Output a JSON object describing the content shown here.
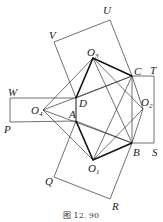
{
  "figure": {
    "caption": "图 12. 90",
    "points": {
      "O1": [
        93,
        160
      ],
      "O2": [
        143,
        109
      ],
      "O3": [
        93,
        58
      ],
      "O4": [
        43,
        110
      ],
      "A": [
        76,
        121
      ],
      "B": [
        132,
        143
      ],
      "C": [
        132,
        76
      ],
      "D": [
        76,
        98
      ],
      "P": [
        10,
        122
      ],
      "W": [
        10,
        98
      ],
      "Q": [
        54,
        177
      ],
      "R": [
        110,
        199
      ],
      "S": [
        154,
        143
      ],
      "T": [
        154,
        76
      ],
      "U": [
        110,
        20
      ],
      "V": [
        54,
        42
      ]
    },
    "labels": [
      {
        "text": "U",
        "sub": "",
        "x": 103,
        "y": 14
      },
      {
        "text": "V",
        "sub": "",
        "x": 49,
        "y": 39
      },
      {
        "text": "O",
        "sub": "3",
        "x": 87,
        "y": 56
      },
      {
        "text": "C",
        "sub": "",
        "x": 134,
        "y": 75
      },
      {
        "text": "T",
        "sub": "",
        "x": 150,
        "y": 74
      },
      {
        "text": "W",
        "sub": "",
        "x": 8,
        "y": 96
      },
      {
        "text": "D",
        "sub": "",
        "x": 79,
        "y": 107
      },
      {
        "text": "O",
        "sub": "2",
        "x": 141,
        "y": 106
      },
      {
        "text": "O",
        "sub": "4",
        "x": 31,
        "y": 114
      },
      {
        "text": "A",
        "sub": "",
        "x": 69,
        "y": 118
      },
      {
        "text": "P",
        "sub": "",
        "x": 4,
        "y": 133
      },
      {
        "text": "B",
        "sub": "",
        "x": 133,
        "y": 156
      },
      {
        "text": "S",
        "sub": "",
        "x": 152,
        "y": 156
      },
      {
        "text": "O",
        "sub": "1",
        "x": 88,
        "y": 172
      },
      {
        "text": "Q",
        "sub": "",
        "x": 45,
        "y": 185
      },
      {
        "text": "R",
        "sub": "",
        "x": 112,
        "y": 210
      }
    ]
  }
}
